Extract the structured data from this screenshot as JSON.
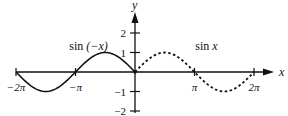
{
  "chart_data": {
    "type": "line",
    "title": "",
    "xlabel": "x",
    "ylabel": "y",
    "xlim": [
      -6.2832,
      6.2832
    ],
    "ylim": [
      -2,
      2
    ],
    "x_ticks": [
      {
        "value": -6.2832,
        "label": "−2π"
      },
      {
        "value": -3.1416,
        "label": "−π"
      },
      {
        "value": 3.1416,
        "label": "π"
      },
      {
        "value": 6.2832,
        "label": "2π"
      }
    ],
    "y_ticks": [
      {
        "value": 2,
        "label": "2"
      },
      {
        "value": 1,
        "label": "1"
      },
      {
        "value": -1,
        "label": "−1"
      },
      {
        "value": -2,
        "label": "−2"
      }
    ],
    "series": [
      {
        "name": "sin (−x)",
        "function": "sin(-x)",
        "domain": [
          -6.2832,
          0
        ],
        "style": "solid",
        "label": "sin (−x)",
        "label_near_x": -3.14
      },
      {
        "name": "sin x",
        "function": "sin(x)",
        "domain": [
          0,
          6.2832
        ],
        "style": "dashed",
        "label": "sin x",
        "label_near_x": 3.14
      }
    ],
    "grid": false,
    "legend": "none"
  }
}
